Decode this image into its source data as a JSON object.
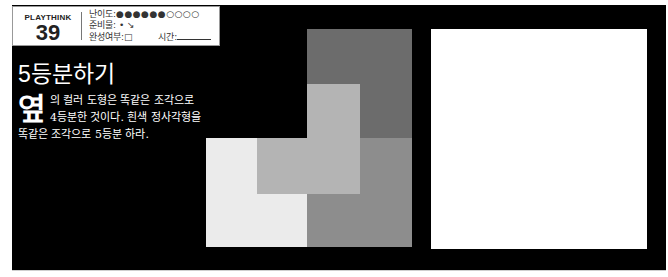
{
  "header": {
    "brand": "PLAYTHINK",
    "number": "39",
    "difficulty_label": "난이도:",
    "difficulty_dots": "●●●●●●○○○○",
    "difficulty_filled": 6,
    "difficulty_total": 10,
    "supplies_label": "준비물:",
    "supplies_icons": "• ↘",
    "completion_label": "완성여부:",
    "completion_checkbox": "□",
    "time_label": "시간:"
  },
  "puzzle": {
    "title": "5등분하기",
    "dropcap": "옆",
    "body": "의 컬러 도형은 똑같은 조각으로 4등분한 것이다. 흰색 정사각형을 똑같은 조각으로 5등분 하라."
  },
  "figure": {
    "colors": {
      "dark": "#6c6c6c",
      "light_mid": "#b4b4b4",
      "lightest": "#ebebeb",
      "mid": "#8d8d8d",
      "white_square": "#ffffff",
      "background": "#000000"
    }
  }
}
